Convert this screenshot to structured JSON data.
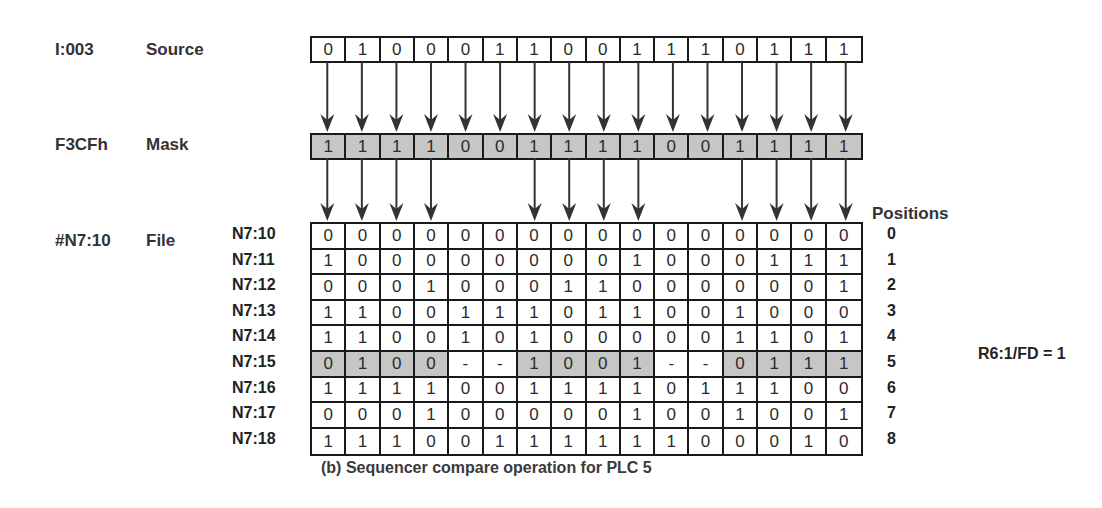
{
  "colors": {
    "shade": "#c6c6c6",
    "line": "#1a1a1a",
    "text": "#2b2b2b"
  },
  "source": {
    "address": "I:003",
    "name": "Source",
    "bits": [
      "0",
      "1",
      "0",
      "0",
      "0",
      "1",
      "1",
      "0",
      "0",
      "1",
      "1",
      "1",
      "0",
      "1",
      "1",
      "1"
    ]
  },
  "mask": {
    "address": "F3CFh",
    "name": "Mask",
    "bits": [
      "1",
      "1",
      "1",
      "1",
      "0",
      "0",
      "1",
      "1",
      "1",
      "1",
      "0",
      "0",
      "1",
      "1",
      "1",
      "1"
    ]
  },
  "file": {
    "address": "#N7:10",
    "name": "File",
    "positions_label": "Positions",
    "rows": [
      {
        "label": "N7:10",
        "position": "0",
        "bits": [
          "0",
          "0",
          "0",
          "0",
          "0",
          "0",
          "0",
          "0",
          "0",
          "0",
          "0",
          "0",
          "0",
          "0",
          "0",
          "0"
        ]
      },
      {
        "label": "N7:11",
        "position": "1",
        "bits": [
          "1",
          "0",
          "0",
          "0",
          "0",
          "0",
          "0",
          "0",
          "0",
          "1",
          "0",
          "0",
          "0",
          "1",
          "1",
          "1"
        ]
      },
      {
        "label": "N7:12",
        "position": "2",
        "bits": [
          "0",
          "0",
          "0",
          "1",
          "0",
          "0",
          "0",
          "1",
          "1",
          "0",
          "0",
          "0",
          "0",
          "0",
          "0",
          "1"
        ]
      },
      {
        "label": "N7:13",
        "position": "3",
        "bits": [
          "1",
          "1",
          "0",
          "0",
          "1",
          "1",
          "1",
          "0",
          "1",
          "1",
          "0",
          "0",
          "1",
          "0",
          "0",
          "0"
        ]
      },
      {
        "label": "N7:14",
        "position": "4",
        "bits": [
          "1",
          "1",
          "0",
          "0",
          "1",
          "0",
          "1",
          "0",
          "0",
          "0",
          "0",
          "0",
          "1",
          "1",
          "0",
          "1"
        ]
      },
      {
        "label": "N7:15",
        "position": "5",
        "highlighted": true,
        "bits": [
          "0",
          "1",
          "0",
          "0",
          "-",
          "-",
          "1",
          "0",
          "0",
          "1",
          "-",
          "-",
          "0",
          "1",
          "1",
          "1"
        ]
      },
      {
        "label": "N7:16",
        "position": "6",
        "bits": [
          "1",
          "1",
          "1",
          "1",
          "0",
          "0",
          "1",
          "1",
          "1",
          "1",
          "0",
          "1",
          "1",
          "1",
          "0",
          "0"
        ]
      },
      {
        "label": "N7:17",
        "position": "7",
        "bits": [
          "0",
          "0",
          "0",
          "1",
          "0",
          "0",
          "0",
          "0",
          "0",
          "1",
          "0",
          "0",
          "1",
          "0",
          "0",
          "1"
        ]
      },
      {
        "label": "N7:18",
        "position": "8",
        "bits": [
          "1",
          "1",
          "1",
          "0",
          "0",
          "1",
          "1",
          "1",
          "1",
          "1",
          "1",
          "0",
          "0",
          "0",
          "1",
          "0"
        ]
      }
    ]
  },
  "status": {
    "text": "R6:1/FD = 1"
  },
  "caption": "(b) Sequencer compare operation for PLC 5"
}
